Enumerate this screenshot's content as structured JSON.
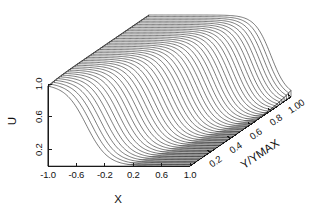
{
  "chart_data": {
    "type": "line",
    "subtype": "3d-waterfall-mesh-surface",
    "title": "",
    "xlabel": "X",
    "ylabel": "U",
    "zlabel": "Y/YMAX",
    "xlim": [
      -1.0,
      1.0
    ],
    "ylim": [
      0.0,
      1.0
    ],
    "zlim": [
      0.0,
      1.0
    ],
    "grid": false,
    "legend": null,
    "line_color": "#2b2b2b",
    "background_color": "#ffffff",
    "axis_color": "#1a1a1a",
    "x_ticks": [
      -1.0,
      -0.6,
      -0.2,
      0.2,
      0.6,
      1.0
    ],
    "x_tick_labels": [
      "-1.0",
      "-0.6",
      "-0.2",
      "0.2",
      "0.6",
      "1.0"
    ],
    "u_ticks": [
      0.2,
      0.6,
      1.0
    ],
    "u_tick_labels": [
      "0.2",
      "0.6",
      "1.0"
    ],
    "z_ticks": [
      0.2,
      0.4,
      0.6,
      0.8,
      1.0
    ],
    "z_tick_labels": [
      "0.2",
      "0.4",
      "0.6",
      "0.8",
      "1.00"
    ],
    "n_curves": 45,
    "points_per_curve": 121,
    "surface_model": {
      "formula": "U(x,z) = 0.5 * (1 - tanh((x - x0(z)) / w(z)))",
      "front_center": -0.46,
      "back_center": 0.72,
      "front_width": 0.3,
      "back_width": 0.23,
      "center_curvature": 0.3
    },
    "series": [
      {
        "name": "z=0.00",
        "z": 0.0,
        "x0": -0.46,
        "width": 0.3
      },
      {
        "name": "z=0.25",
        "z": 0.25,
        "x0": -0.21,
        "width": 0.282
      },
      {
        "name": "z=0.50",
        "z": 0.5,
        "x0": 0.11,
        "width": 0.264
      },
      {
        "name": "z=0.75",
        "z": 0.75,
        "x0": 0.44,
        "width": 0.246
      },
      {
        "name": "z=1.00",
        "z": 1.0,
        "x0": 0.72,
        "width": 0.23
      }
    ],
    "sample_profile_front": {
      "x": [
        -1.0,
        -0.8,
        -0.6,
        -0.4,
        -0.2,
        0.0,
        0.2,
        0.4,
        0.6,
        0.8,
        1.0
      ],
      "u": [
        0.97,
        0.89,
        0.7,
        0.42,
        0.19,
        0.07,
        0.02,
        0.01,
        0.0,
        0.0,
        0.0
      ]
    },
    "sample_profile_back": {
      "x": [
        -1.0,
        -0.8,
        -0.6,
        -0.4,
        -0.2,
        0.0,
        0.2,
        0.4,
        0.6,
        0.8,
        1.0
      ],
      "u": [
        1.0,
        1.0,
        1.0,
        0.99,
        0.98,
        0.95,
        0.88,
        0.71,
        0.44,
        0.2,
        0.07
      ]
    },
    "projection": {
      "origin_x": 48,
      "origin_y": 166,
      "x_axis_dx": 142,
      "x_axis_dy": 0,
      "u_axis_dy": -82,
      "z_axis_dx": 101,
      "z_axis_dy": -69
    }
  },
  "axes": {
    "x_title": "X",
    "u_title": "U",
    "z_title": "Y/YMAX"
  }
}
